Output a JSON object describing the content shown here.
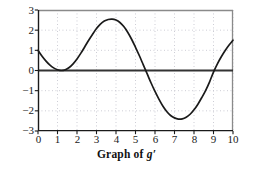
{
  "caption": {
    "prefix": "Graph of ",
    "function_name": "g",
    "prime": "′",
    "full_text": "Graph of g′"
  },
  "colors": {
    "curve": "#1a1a1a",
    "axis": "#1a1a1a",
    "zero_line": "#333333",
    "gridline": "#b9b9c4",
    "frame": "#8a8a8a",
    "background": "#ffffff",
    "text": "#1a1a1a"
  },
  "chart_data": {
    "type": "line",
    "title": "",
    "subtitle": "",
    "xlabel": "Graph of g′",
    "ylabel": "",
    "xlim": [
      0,
      10
    ],
    "ylim": [
      -3,
      3
    ],
    "xticks": [
      0,
      1,
      2,
      3,
      4,
      5,
      6,
      7,
      8,
      9,
      10
    ],
    "xtick_labels": [
      "0",
      "1",
      "2",
      "3",
      "4",
      "5",
      "6",
      "7",
      "8",
      "9",
      "10"
    ],
    "yticks": [
      -3,
      -2,
      -1,
      0,
      1,
      2,
      3
    ],
    "ytick_labels": [
      "−3",
      "−2",
      "−1",
      "0",
      "1",
      "2",
      "3"
    ],
    "grid": true,
    "grid_style": "dotted",
    "legend": false,
    "legend_position": "none",
    "zero_line": true,
    "annotations": [],
    "series": [
      {
        "name": "g'",
        "x": [
          0.0,
          0.2,
          0.4,
          0.6,
          0.8,
          1.0,
          1.2,
          1.4,
          1.6,
          1.8,
          2.0,
          2.2,
          2.4,
          2.6,
          2.8,
          3.0,
          3.2,
          3.4,
          3.6,
          3.8,
          4.0,
          4.2,
          4.4,
          4.6,
          4.8,
          5.0,
          5.2,
          5.4,
          5.6,
          5.8,
          6.0,
          6.2,
          6.4,
          6.6,
          6.8,
          7.0,
          7.2,
          7.4,
          7.6,
          7.8,
          8.0,
          8.2,
          8.4,
          8.6,
          8.8,
          9.0,
          9.2,
          9.4,
          9.6,
          9.8,
          10.0
        ],
        "y": [
          1.0,
          0.72,
          0.48,
          0.28,
          0.13,
          0.04,
          0.0,
          0.04,
          0.15,
          0.33,
          0.57,
          0.86,
          1.18,
          1.5,
          1.8,
          2.08,
          2.3,
          2.45,
          2.53,
          2.55,
          2.5,
          2.38,
          2.18,
          1.9,
          1.55,
          1.15,
          0.73,
          0.28,
          -0.17,
          -0.62,
          -1.04,
          -1.42,
          -1.76,
          -2.03,
          -2.23,
          -2.35,
          -2.41,
          -2.4,
          -2.32,
          -2.17,
          -1.95,
          -1.67,
          -1.34,
          -0.98,
          -0.56,
          -0.08,
          0.33,
          0.68,
          0.99,
          1.26,
          1.5
        ]
      }
    ],
    "key_points": {
      "start": {
        "x": 0,
        "y": 1.0
      },
      "zero_touch_minimum": {
        "x": 1.2,
        "y": 0.0
      },
      "maximum": {
        "x": 3.8,
        "y": 2.55
      },
      "zero_crossing_descending": {
        "x": 5.5,
        "y": 0.0
      },
      "minimum": {
        "x": 7.3,
        "y": -2.41
      },
      "zero_crossing_ascending": {
        "x": 9.05,
        "y": 0.0
      },
      "end": {
        "x": 10,
        "y": 1.5
      }
    }
  }
}
